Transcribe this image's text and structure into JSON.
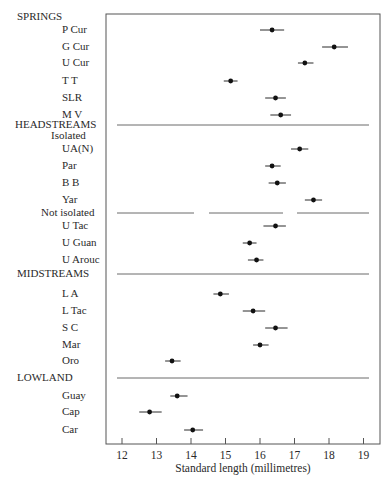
{
  "chart_data": {
    "type": "scatter",
    "subtype": "dot-with-horizontal-error-bars",
    "title": "",
    "xlabel": "Standard length (millimetres)",
    "ylabel": "",
    "xlim": [
      11.55,
      19.5
    ],
    "xticks": [
      12,
      13,
      14,
      15,
      16,
      17,
      18,
      19
    ],
    "grid": false,
    "legend": null,
    "groups": [
      {
        "name": "SPRINGS",
        "subgroups": [
          {
            "name": "",
            "items": [
              {
                "label": "P Cur",
                "value": 16.35,
                "low": 16.0,
                "high": 16.7
              },
              {
                "label": "G Cur",
                "value": 18.15,
                "low": 17.8,
                "high": 18.55
              },
              {
                "label": "U Cur",
                "value": 17.3,
                "low": 17.1,
                "high": 17.55
              },
              {
                "label": "T T",
                "value": 15.15,
                "low": 14.95,
                "high": 15.35
              },
              {
                "label": "SLR",
                "value": 16.45,
                "low": 16.15,
                "high": 16.75
              },
              {
                "label": "M V",
                "value": 16.6,
                "low": 16.3,
                "high": 16.9
              }
            ]
          }
        ]
      },
      {
        "name": "HEADSTREAMS",
        "subgroups": [
          {
            "name": "Isolated",
            "items": [
              {
                "label": "UA(N)",
                "value": 17.15,
                "low": 16.9,
                "high": 17.4
              },
              {
                "label": "Par",
                "value": 16.35,
                "low": 16.15,
                "high": 16.6
              },
              {
                "label": "B B",
                "value": 16.5,
                "low": 16.25,
                "high": 16.75
              },
              {
                "label": "Yar",
                "value": 17.55,
                "low": 17.3,
                "high": 17.8
              }
            ]
          },
          {
            "name": "Not  isolated",
            "items": [
              {
                "label": "U Tac",
                "value": 16.45,
                "low": 16.1,
                "high": 16.75
              },
              {
                "label": "U Guan",
                "value": 15.7,
                "low": 15.5,
                "high": 15.9
              },
              {
                "label": "U Arouc",
                "value": 15.9,
                "low": 15.65,
                "high": 16.1
              }
            ]
          }
        ]
      },
      {
        "name": "MIDSTREAMS",
        "subgroups": [
          {
            "name": "",
            "items": [
              {
                "label": "L A",
                "value": 14.85,
                "low": 14.65,
                "high": 15.1
              },
              {
                "label": "L Tac",
                "value": 15.8,
                "low": 15.5,
                "high": 16.15
              },
              {
                "label": "S C",
                "value": 16.45,
                "low": 16.15,
                "high": 16.8
              },
              {
                "label": "Mar",
                "value": 16.0,
                "low": 15.8,
                "high": 16.25
              }
            ]
          }
        ]
      },
      {
        "name": "LOWLAND",
        "subgroups": [
          {
            "name": "",
            "items": [
              {
                "label": "Oro",
                "value": 13.45,
                "low": 13.25,
                "high": 13.7
              },
              {
                "label": "Guay",
                "value": 13.6,
                "low": 13.4,
                "high": 13.9
              },
              {
                "label": "Cap",
                "value": 12.8,
                "low": 12.5,
                "high": 13.15
              },
              {
                "label": "Car",
                "value": 14.05,
                "low": 13.8,
                "high": 14.35
              }
            ]
          }
        ]
      }
    ]
  },
  "layout_rows": [
    {
      "kind": "section",
      "text": "SPRINGS",
      "y": 17
    },
    {
      "kind": "item",
      "text": "P Cur",
      "y": 30,
      "value": 16.35,
      "low": 16.0,
      "high": 16.7
    },
    {
      "kind": "item",
      "text": "G Cur",
      "y": 47,
      "value": 18.15,
      "low": 17.8,
      "high": 18.55
    },
    {
      "kind": "item",
      "text": "U Cur",
      "y": 63,
      "value": 17.3,
      "low": 17.1,
      "high": 17.55
    },
    {
      "kind": "item",
      "text": "T T",
      "y": 81,
      "value": 15.15,
      "low": 14.95,
      "high": 15.35
    },
    {
      "kind": "item",
      "text": "SLR",
      "y": 98,
      "value": 16.45,
      "low": 16.15,
      "high": 16.75
    },
    {
      "kind": "item",
      "text": "M V",
      "y": 115,
      "value": 16.6,
      "low": 16.3,
      "high": 16.9
    },
    {
      "kind": "section",
      "text": "HEADSTREAMS",
      "y": 125,
      "separator": "full"
    },
    {
      "kind": "subsection",
      "text": "Isolated",
      "y": 136
    },
    {
      "kind": "item",
      "text": "UA(N)",
      "y": 149,
      "value": 17.15,
      "low": 16.9,
      "high": 17.4
    },
    {
      "kind": "item",
      "text": "Par",
      "y": 166,
      "value": 16.35,
      "low": 16.15,
      "high": 16.6
    },
    {
      "kind": "item",
      "text": "B B",
      "y": 183,
      "value": 16.5,
      "low": 16.25,
      "high": 16.75
    },
    {
      "kind": "item",
      "text": "Yar",
      "y": 200,
      "value": 17.55,
      "low": 17.3,
      "high": 17.8
    },
    {
      "kind": "subsection",
      "text": "Not  isolated",
      "y": 213,
      "separator": "broken"
    },
    {
      "kind": "item",
      "text": "U Tac",
      "y": 226,
      "value": 16.45,
      "low": 16.1,
      "high": 16.75
    },
    {
      "kind": "item",
      "text": "U Guan",
      "y": 243,
      "value": 15.7,
      "low": 15.5,
      "high": 15.9
    },
    {
      "kind": "item",
      "text": "U Arouc",
      "y": 260,
      "value": 15.9,
      "low": 15.65,
      "high": 16.1
    },
    {
      "kind": "section",
      "text": "MIDSTREAMS",
      "y": 274,
      "separator": "full"
    },
    {
      "kind": "item",
      "text": "L A",
      "y": 294,
      "value": 14.85,
      "low": 14.65,
      "high": 15.1
    },
    {
      "kind": "item",
      "text": "L Tac",
      "y": 311,
      "value": 15.8,
      "low": 15.5,
      "high": 16.15
    },
    {
      "kind": "item",
      "text": "S C",
      "y": 328,
      "value": 16.45,
      "low": 16.15,
      "high": 16.8
    },
    {
      "kind": "item",
      "text": "Mar",
      "y": 345,
      "value": 16.0,
      "low": 15.8,
      "high": 16.25
    },
    {
      "kind": "item",
      "text": "Oro",
      "y": 361,
      "value": 13.45,
      "low": 13.25,
      "high": 13.7
    },
    {
      "kind": "section",
      "text": "LOWLAND",
      "y": 378,
      "separator": "full"
    },
    {
      "kind": "item",
      "text": "Guay",
      "y": 396,
      "value": 13.6,
      "low": 13.4,
      "high": 13.9
    },
    {
      "kind": "item",
      "text": "Cap",
      "y": 412,
      "value": 12.8,
      "low": 12.5,
      "high": 13.15
    },
    {
      "kind": "item",
      "text": "Car",
      "y": 430,
      "value": 14.05,
      "low": 13.8,
      "high": 14.35
    }
  ],
  "colors": {
    "ink": "#2a2a2a",
    "frame": "#555555",
    "separator": "#6a6a6a",
    "background": "#ffffff"
  }
}
